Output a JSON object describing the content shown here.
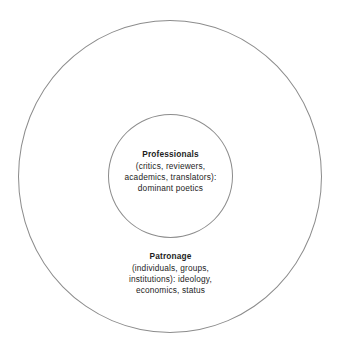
{
  "diagram": {
    "type": "concentric-circles",
    "background_color": "#ffffff",
    "stroke_color": "#8c8c8c",
    "text_color": "#1d1d1d",
    "outer_region": {
      "name": "Patronage",
      "title": "Patronage",
      "lines": [
        "(individuals, groups,",
        "institutions): ideology,",
        "economics, status"
      ]
    },
    "inner_region": {
      "name": "Professionals",
      "title": "Professionals",
      "lines": [
        "(critics, reviewers,",
        "academics, translators):",
        "dominant poetics"
      ]
    }
  }
}
